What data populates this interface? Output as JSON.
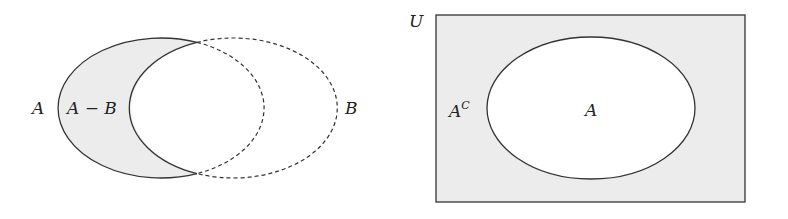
{
  "colors": {
    "shade": "#ececec",
    "stroke": "#333333",
    "background": "#ffffff"
  },
  "left_diagram": {
    "title": "Set difference",
    "label_a": "A",
    "label_diff": "A − B",
    "label_b": "B",
    "set_a": {
      "cx": 162,
      "cy": 108,
      "rx": 103,
      "ry": 70,
      "style": "solid"
    },
    "set_b": {
      "cx": 235,
      "cy": 108,
      "rx": 104,
      "ry": 70,
      "style": "dashed"
    },
    "shaded_region": "A − B"
  },
  "right_diagram": {
    "title": "Complement",
    "label_universe": "U",
    "label_complement_base": "A",
    "label_complement_sup": "C",
    "label_a": "A",
    "universe": {
      "x": 436,
      "y": 15,
      "width": 309,
      "height": 187
    },
    "set_a": {
      "cx": 591,
      "cy": 108,
      "rx": 104,
      "ry": 71
    },
    "shaded_region": "A^C"
  }
}
